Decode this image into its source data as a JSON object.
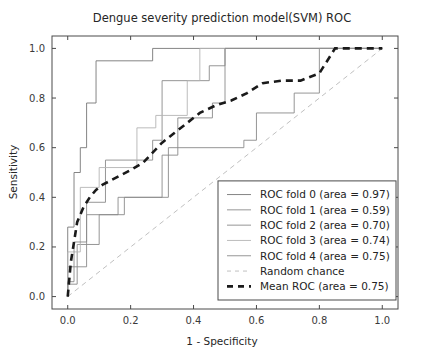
{
  "chart_data": {
    "type": "line",
    "title": "Dengue severity prediction model(SVM) ROC",
    "xlabel": "1 - Specificity",
    "ylabel": "Sensitivity",
    "xlim": [
      -0.05,
      1.05
    ],
    "ylim": [
      -0.05,
      1.05
    ],
    "xticks": [
      "0.0",
      "0.2",
      "0.4",
      "0.6",
      "0.8",
      "1.0"
    ],
    "xtick_values": [
      0.0,
      0.2,
      0.4,
      0.6,
      0.8,
      1.0
    ],
    "yticks": [
      "0.0",
      "0.2",
      "0.4",
      "0.6",
      "0.8",
      "1.0"
    ],
    "ytick_values": [
      0.0,
      0.2,
      0.4,
      0.6,
      0.8,
      1.0
    ],
    "grid": false,
    "legend_position": "lower right",
    "series": [
      {
        "name": "ROC fold 0 (area = 0.97)",
        "area": 0.97,
        "style": "solid",
        "color": "#777777",
        "width": 0.9,
        "x": [
          0.0,
          0.0,
          0.02,
          0.02,
          0.04,
          0.04,
          0.06,
          0.06,
          0.09,
          0.09,
          0.27,
          0.27,
          1.0
        ],
        "y": [
          0.0,
          0.28,
          0.28,
          0.5,
          0.5,
          0.6,
          0.6,
          0.78,
          0.78,
          0.95,
          0.95,
          1.0,
          1.0
        ]
      },
      {
        "name": "ROC fold 1 (area = 0.59)",
        "area": 0.59,
        "style": "solid",
        "color": "#8a8a8a",
        "width": 0.9,
        "x": [
          0.0,
          0.0,
          0.03,
          0.03,
          0.1,
          0.1,
          0.18,
          0.18,
          0.32,
          0.32,
          0.56,
          0.56,
          0.6,
          0.6,
          0.72,
          0.72,
          0.8,
          0.8,
          1.0
        ],
        "y": [
          0.0,
          0.05,
          0.05,
          0.21,
          0.21,
          0.33,
          0.33,
          0.4,
          0.4,
          0.6,
          0.6,
          0.63,
          0.63,
          0.74,
          0.74,
          0.82,
          0.82,
          1.0,
          1.0
        ]
      },
      {
        "name": "ROC fold 2 (area = 0.70)",
        "area": 0.7,
        "style": "solid",
        "color": "#8a8a8a",
        "width": 0.9,
        "x": [
          0.0,
          0.0,
          0.06,
          0.06,
          0.12,
          0.12,
          0.27,
          0.27,
          0.3,
          0.3,
          0.45,
          0.45,
          0.5,
          0.5,
          1.0
        ],
        "y": [
          0.0,
          0.12,
          0.12,
          0.38,
          0.38,
          0.55,
          0.55,
          0.63,
          0.63,
          0.87,
          0.87,
          0.93,
          0.93,
          1.0,
          1.0
        ]
      },
      {
        "name": "ROC fold 3 (area = 0.74)",
        "area": 0.74,
        "style": "solid",
        "color": "#b4b4b4",
        "width": 0.9,
        "x": [
          0.0,
          0.0,
          0.04,
          0.04,
          0.1,
          0.1,
          0.22,
          0.22,
          0.28,
          0.28,
          0.38,
          0.38,
          0.42,
          0.42,
          1.0
        ],
        "y": [
          0.0,
          0.18,
          0.18,
          0.44,
          0.44,
          0.52,
          0.52,
          0.68,
          0.68,
          0.73,
          0.73,
          0.87,
          0.87,
          1.0,
          1.0
        ]
      },
      {
        "name": "ROC fold 4 (area = 0.75)",
        "area": 0.75,
        "style": "solid",
        "color": "#8a8a8a",
        "width": 0.9,
        "x": [
          0.0,
          0.0,
          0.02,
          0.02,
          0.06,
          0.06,
          0.16,
          0.16,
          0.3,
          0.3,
          0.35,
          0.35,
          0.46,
          0.46,
          0.5,
          0.5,
          1.0
        ],
        "y": [
          0.0,
          0.06,
          0.06,
          0.22,
          0.22,
          0.33,
          0.33,
          0.4,
          0.4,
          0.57,
          0.57,
          0.72,
          0.72,
          0.78,
          0.78,
          1.0,
          1.0
        ]
      },
      {
        "name": "Random chance",
        "style": "dashed",
        "color": "#c0c0c0",
        "width": 1.0,
        "x": [
          0.0,
          1.0
        ],
        "y": [
          0.0,
          1.0
        ]
      },
      {
        "name": "Mean ROC (area = 0.75)",
        "area": 0.75,
        "style": "dashed-thick",
        "color": "#1a1a1a",
        "width": 2.6,
        "x": [
          0.0,
          0.01,
          0.02,
          0.03,
          0.05,
          0.07,
          0.09,
          0.11,
          0.14,
          0.17,
          0.2,
          0.24,
          0.27,
          0.3,
          0.34,
          0.38,
          0.42,
          0.47,
          0.52,
          0.57,
          0.62,
          0.68,
          0.74,
          0.8,
          0.85,
          0.92,
          1.0
        ],
        "y": [
          0.0,
          0.14,
          0.22,
          0.3,
          0.36,
          0.4,
          0.43,
          0.45,
          0.47,
          0.49,
          0.51,
          0.54,
          0.58,
          0.62,
          0.66,
          0.7,
          0.74,
          0.77,
          0.79,
          0.82,
          0.86,
          0.87,
          0.87,
          0.9,
          1.0,
          1.0,
          1.0
        ]
      }
    ],
    "legend_entries": [
      {
        "label": "ROC fold 0 (area = 0.97)",
        "style": "solid",
        "color": "#777777"
      },
      {
        "label": "ROC fold 1 (area = 0.59)",
        "style": "solid",
        "color": "#8a8a8a"
      },
      {
        "label": "ROC fold 2 (area = 0.70)",
        "style": "solid",
        "color": "#8a8a8a"
      },
      {
        "label": "ROC fold 3 (area = 0.74)",
        "style": "solid",
        "color": "#b4b4b4"
      },
      {
        "label": "ROC fold 4 (area = 0.75)",
        "style": "solid",
        "color": "#8a8a8a"
      },
      {
        "label": "Random chance",
        "style": "dashed",
        "color": "#c0c0c0"
      },
      {
        "label": "Mean ROC (area = 0.75)",
        "style": "dashed-thick",
        "color": "#1a1a1a"
      }
    ]
  }
}
